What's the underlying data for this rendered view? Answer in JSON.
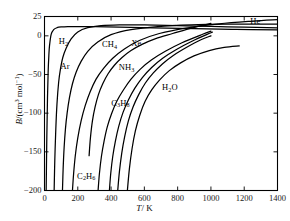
{
  "chart_data": {
    "type": "line",
    "title": "",
    "xlabel": "T/K",
    "ylabel": "B/(cm3 mol-1)",
    "xlim": [
      0,
      1400
    ],
    "ylim": [
      -200,
      25
    ],
    "grid": false,
    "legend": "inline-curve-labels",
    "xticks": [
      0,
      200,
      400,
      600,
      800,
      1000,
      1200,
      1400
    ],
    "xtick_labels": [
      "0",
      "200",
      "400",
      "600",
      "800",
      "1000",
      "1200",
      "1400"
    ],
    "yticks": [
      25,
      0,
      -50,
      -100,
      -150,
      -200
    ],
    "ytick_labels": [
      "25",
      "0",
      "−50",
      "−100",
      "−150",
      "−200"
    ],
    "series": [
      {
        "name": "He",
        "label": "He",
        "label_x": 1290,
        "label_y": 18,
        "x": [
          10,
          14,
          18,
          22,
          26,
          30,
          40,
          55,
          75,
          100,
          140,
          200,
          300,
          450,
          650,
          900,
          1150,
          1400
        ],
        "y": [
          -200,
          -130,
          -80,
          -46,
          -26,
          -13,
          2,
          8,
          10.5,
          11.5,
          12,
          12,
          11.8,
          11.2,
          10.4,
          9.4,
          8.4,
          7.6
        ]
      },
      {
        "name": "H2",
        "label": "H2",
        "label_x": 140,
        "label_y": -8,
        "x": [
          58,
          62,
          68,
          75,
          85,
          95,
          110,
          130,
          160,
          200,
          260,
          340,
          450,
          600,
          800,
          1000,
          1200,
          1400
        ],
        "y": [
          -200,
          -160,
          -120,
          -88,
          -60,
          -44,
          -28,
          -16,
          -4,
          5,
          10.5,
          13.2,
          14.2,
          14.2,
          13.2,
          12.2,
          11.2,
          10.4
        ]
      },
      {
        "name": "Ar",
        "label": "Ar",
        "label_x": 150,
        "label_y": -40,
        "x": [
          108,
          112,
          118,
          126,
          136,
          150,
          168,
          190,
          220,
          260,
          320,
          400,
          520,
          680,
          880,
          1100,
          1400
        ],
        "y": [
          -200,
          -172,
          -144,
          -120,
          -100,
          -80,
          -62,
          -47,
          -33,
          -20,
          -8,
          1.5,
          8,
          12,
          14.2,
          15,
          15
        ]
      },
      {
        "name": "CH4",
        "label": "CH4",
        "label_x": 400,
        "label_y": -12,
        "x": [
          168,
          175,
          185,
          200,
          220,
          245,
          275,
          310,
          355,
          410,
          480,
          570,
          690,
          850,
          1050,
          1250,
          1400
        ],
        "y": [
          -200,
          -178,
          -155,
          -132,
          -110,
          -90,
          -72,
          -56,
          -42,
          -29,
          -17,
          -6,
          3,
          10,
          15.5,
          19,
          21
        ]
      },
      {
        "name": "C2H6",
        "label": "C2H6",
        "label_x": 250,
        "label_y": -182,
        "x": [
          268,
          276,
          288,
          304,
          324,
          350,
          382,
          420,
          466,
          520,
          586,
          668,
          770,
          900,
          1000
        ],
        "y": [
          -155,
          -132,
          -110,
          -92,
          -76,
          -62,
          -49,
          -38,
          -28,
          -19,
          -11,
          -3.5,
          3,
          11,
          16
        ]
      },
      {
        "name": "C3H8",
        "label": "C3H8",
        "label_x": 455,
        "label_y": -88,
        "x": [
          322,
          330,
          342,
          358,
          378,
          404,
          436,
          474,
          520,
          576,
          644,
          726,
          826,
          950,
          1000
        ],
        "y": [
          -200,
          -178,
          -156,
          -136,
          -117,
          -100,
          -84,
          -70,
          -56,
          -43,
          -31,
          -20,
          -9,
          2,
          6
        ]
      },
      {
        "name": "Xe",
        "label": "Xe",
        "label_x": 575,
        "label_y": -10,
        "x": [
          390,
          398,
          410,
          426,
          446,
          472,
          504,
          542,
          588,
          644,
          710,
          790,
          886,
          1000,
          1000
        ],
        "y": [
          -200,
          -178,
          -156,
          -136,
          -117,
          -99,
          -83,
          -68,
          -54,
          -41,
          -29,
          -18,
          -7,
          4,
          4
        ]
      },
      {
        "name": "NH3",
        "label": "NH3",
        "label_x": 500,
        "label_y": -42,
        "x": [
          440,
          450,
          464,
          482,
          504,
          532,
          566,
          606,
          654,
          710,
          776,
          852,
          940,
          1000
        ],
        "y": [
          -200,
          -176,
          -152,
          -130,
          -110,
          -92,
          -76,
          -61,
          -48,
          -36,
          -25,
          -15,
          -5,
          0
        ]
      },
      {
        "name": "H2O",
        "label": "H2O",
        "label_x": 760,
        "label_y": -68,
        "x": [
          498,
          510,
          526,
          546,
          572,
          604,
          644,
          692,
          750,
          818,
          898,
          990,
          1080,
          1170
        ],
        "y": [
          -200,
          -172,
          -146,
          -123,
          -103,
          -85,
          -70,
          -57,
          -45,
          -35,
          -26,
          -19,
          -15,
          -13
        ]
      }
    ]
  },
  "axis": {
    "x_title_symbol": "T",
    "x_title_rest": "/ K",
    "y_title_symbol": "B",
    "y_title_rest_a": "/(cm",
    "y_title_sup_a": "3",
    "y_title_rest_b": " mol",
    "y_title_sup_b": "−1",
    "y_title_rest_c": ")"
  }
}
